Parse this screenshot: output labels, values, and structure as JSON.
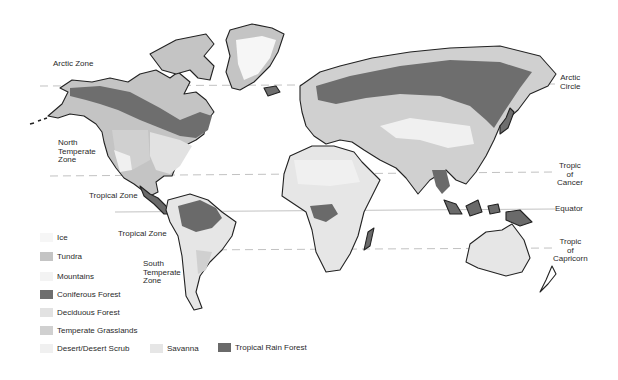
{
  "colors": {
    "ice": "#f6f6f6",
    "tundra": "#c4c4c4",
    "mountains": "#f3f3f3",
    "coniferous_forest": "#6e6e6e",
    "deciduous_forest": "#e2e2e2",
    "temperate_grasslands": "#d0d0d0",
    "desert": "#f0f0f0",
    "savanna": "#e6e6e6",
    "tropical_rain_forest": "#6a6a6a",
    "outline": "#222222",
    "line": "#bdbdbd"
  },
  "zone_labels": {
    "arctic_zone": "Arctic  Zone",
    "north_temperate": "North\nTemperate\nZone",
    "tropical_zone_north": "Tropical Zone",
    "tropical_zone_south": "Tropical Zone",
    "south_temperate": "South\nTemperate\nZone"
  },
  "line_labels": {
    "arctic_circle": "Arctic\nCircle",
    "tropic_of_cancer": "Tropic\nof\nCancer",
    "equator": "Equator",
    "tropic_of_capricorn": "Tropic\nof\nCapricorn"
  },
  "legend": [
    {
      "key": "ice",
      "label": "Ice"
    },
    {
      "key": "tundra",
      "label": "Tundra"
    },
    {
      "key": "mountains",
      "label": "Mountains"
    },
    {
      "key": "coniferous_forest",
      "label": "Coniferous Forest"
    },
    {
      "key": "deciduous_forest",
      "label": "Deciduous Forest"
    },
    {
      "key": "temperate_grasslands",
      "label": "Temperate Grasslands"
    },
    {
      "key": "desert",
      "label": "Desert/Desert Scrub"
    },
    {
      "key": "savanna",
      "label": "Savanna"
    },
    {
      "key": "tropical_rain_forest",
      "label": "Tropical Rain Forest"
    }
  ]
}
